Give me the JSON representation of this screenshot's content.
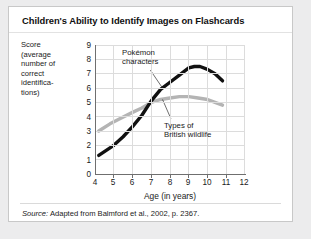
{
  "card": {
    "title": "Children's Ability to Identify Images on Flashcards",
    "source_lead": "Source:",
    "source_text": "Adapted from Balmford et al., 2002, p. 2367."
  },
  "chart_data": {
    "type": "line",
    "title": "Children's Ability to Identify Images on Flashcards",
    "xlabel": "Age (in years)",
    "ylabel": "Score (average number of correct identifications)",
    "ylabel_lines": [
      "Score",
      "(average",
      "number of",
      "correct",
      "identifica-",
      "tions)"
    ],
    "xlim": [
      4,
      12
    ],
    "ylim": [
      0,
      9
    ],
    "xticks": [
      4,
      5,
      6,
      7,
      8,
      9,
      10,
      11,
      12
    ],
    "yticks": [
      0,
      1,
      2,
      3,
      4,
      5,
      6,
      7,
      8,
      9
    ],
    "grid": true,
    "legend": "annotations",
    "series": [
      {
        "name": "Pokémon characters",
        "color": "#111111",
        "label_lines": [
          "Pokémon",
          "characters"
        ],
        "x": [
          4.2,
          5.0,
          5.5,
          6.0,
          6.5,
          7.0,
          7.5,
          8.0,
          8.5,
          9.0,
          9.3,
          9.6,
          10.0,
          10.4,
          10.8
        ],
        "y": [
          1.3,
          2.0,
          2.6,
          3.3,
          4.1,
          5.1,
          5.9,
          6.4,
          6.9,
          7.4,
          7.5,
          7.5,
          7.3,
          7.0,
          6.5
        ]
      },
      {
        "name": "Types of British wildlife",
        "color": "#b4b4b4",
        "label_lines": [
          "Types of",
          "British wildlife"
        ],
        "x": [
          4.2,
          4.8,
          5.4,
          6.0,
          6.5,
          7.0,
          7.5,
          8.0,
          8.5,
          9.0,
          9.5,
          10.0,
          10.4,
          10.8
        ],
        "y": [
          3.0,
          3.5,
          3.9,
          4.3,
          4.6,
          5.0,
          5.2,
          5.3,
          5.4,
          5.4,
          5.3,
          5.2,
          5.0,
          4.8
        ]
      }
    ],
    "annotations": [
      {
        "text": "Pokémon characters",
        "points_to_series": "Pokémon characters",
        "anchor_x": 7.6,
        "anchor_y": 6.0
      },
      {
        "text": "Types of British wildlife",
        "points_to_series": "Types of British wildlife",
        "anchor_x": 7.6,
        "anchor_y": 5.2
      }
    ],
    "crossover": {
      "x": 6.7,
      "y": 4.9
    }
  }
}
